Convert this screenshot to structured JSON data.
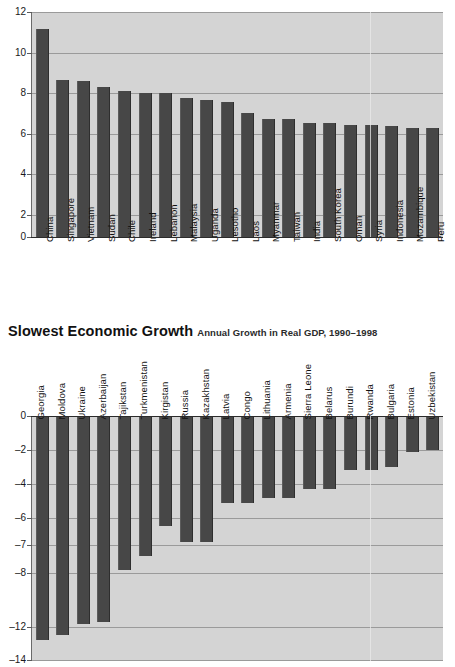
{
  "section": {
    "title": "Slowest Economic Growth",
    "subtitle": "Annual Growth in Real GDP, 1990–1998"
  },
  "chart_data": [
    {
      "id": "fastest-growth",
      "type": "bar",
      "title": "",
      "subtitle": "",
      "xlabel": "",
      "ylabel": "",
      "ylim": [
        0,
        12
      ],
      "yticks": [
        0,
        2,
        4,
        6,
        8,
        10,
        12
      ],
      "yticklabels": [
        "0",
        "2",
        "4",
        "6",
        "8",
        "10",
        "12"
      ],
      "grid": true,
      "legend": "none",
      "categories": [
        "China",
        "Singapore",
        "Vietnam",
        "Sudan",
        "Chile",
        "Ireland",
        "Lebanon",
        "Malaysia",
        "Uganda",
        "Lesotho",
        "Laos",
        "Myanmar",
        "Taiwan",
        "India",
        "South Korea",
        "Oman",
        "Syria",
        "Indonesia",
        "Mozambique",
        "Peru"
      ],
      "values": [
        11.1,
        8.4,
        8.3,
        8.0,
        7.8,
        7.7,
        7.7,
        7.4,
        7.3,
        7.2,
        6.6,
        6.3,
        6.3,
        6.1,
        6.1,
        6.0,
        6.0,
        5.9,
        5.8,
        5.8
      ]
    },
    {
      "id": "slowest-growth",
      "type": "bar",
      "title": "Slowest Economic Growth",
      "subtitle": "Annual Growth in Real GDP, 1990–1998",
      "xlabel": "",
      "ylabel": "",
      "ylim": [
        -14,
        0
      ],
      "yticks": [
        0,
        -2,
        -4,
        -6,
        -7,
        -8,
        -12,
        -14
      ],
      "yticklabels": [
        "0",
        "–2",
        "–4",
        "–6",
        "–7",
        "–8",
        "–12",
        "–14"
      ],
      "grid": true,
      "legend": "none",
      "categories": [
        "Georgia",
        "Moldova",
        "Ukraine",
        "Azerbaijan",
        "Tajikstan",
        "Turkmenistan",
        "Kirgistan",
        "Russia",
        "Kazakhstan",
        "Latvia",
        "Congo",
        "Lithuania",
        "Armenia",
        "Sierra Leone",
        "Belarus",
        "Burundi",
        "Rwanda",
        "Bulgaria",
        "Estonia",
        "Uzbekistan"
      ],
      "values": [
        -12.8,
        -12.5,
        -11.8,
        -11.6,
        -7.9,
        -7.4,
        -6.3,
        -6.9,
        -6.9,
        -5.1,
        -5.1,
        -4.8,
        -4.8,
        -4.3,
        -4.3,
        -3.2,
        -3.2,
        -3.0,
        -2.1,
        -2.0
      ]
    }
  ]
}
